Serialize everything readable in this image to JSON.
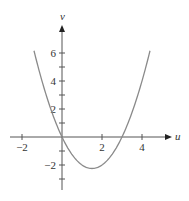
{
  "chart_data": {
    "type": "line",
    "title": "",
    "xlabel": "u",
    "ylabel": "v",
    "function": "v = u^2 - 3u",
    "xlim": [
      -2.6,
      5.0
    ],
    "ylim": [
      -3.8,
      7.5
    ],
    "x_ticks": [
      -2,
      -1,
      1,
      2,
      3,
      4
    ],
    "x_tick_labels": [
      "-2",
      "2",
      "4"
    ],
    "y_ticks": [
      -3,
      -2,
      -1,
      1,
      2,
      3,
      4,
      5,
      6
    ],
    "y_tick_labels": [
      "-2",
      "2",
      "4",
      "6"
    ],
    "grid": false,
    "series": [
      {
        "name": "curve",
        "color": "#8a8a8a",
        "x": [
          -1.4,
          -1,
          -0.5,
          0,
          0.5,
          1,
          1.5,
          2,
          2.5,
          3,
          3.5,
          4,
          4.4
        ],
        "y": [
          6.16,
          4,
          1.75,
          0,
          -1.25,
          -2,
          -2.25,
          -2,
          -1.25,
          0,
          1.75,
          4,
          6.16
        ]
      }
    ]
  },
  "labels": {
    "u": "u",
    "v": "v",
    "x_neg2": "−2",
    "x_2": "2",
    "x_4": "4",
    "y_6": "6",
    "y_4": "4",
    "y_2": "2",
    "y_neg2": "−2"
  }
}
